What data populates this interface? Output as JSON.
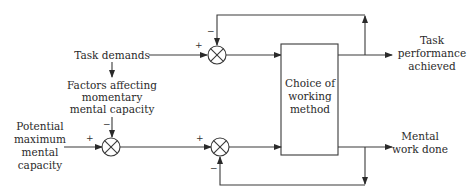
{
  "diagram": {
    "type": "control-loop block diagram",
    "line_color": "#3a3a3a",
    "text_color": "#2a2a2a",
    "background": "#ffffff",
    "nodes": {
      "task_demands": {
        "lines": [
          "Task demands"
        ]
      },
      "factors": {
        "lines": [
          "Factors affecting",
          "momentary",
          "mental capacity"
        ]
      },
      "potential": {
        "lines": [
          "Potential",
          "maximum",
          "mental",
          "capacity"
        ]
      },
      "choice_box": {
        "lines": [
          "Choice of",
          "working",
          "method"
        ]
      },
      "task_performance": {
        "lines": [
          "Task",
          "performance",
          "achieved"
        ]
      },
      "mental_work": {
        "lines": [
          "Mental",
          "work done"
        ]
      }
    },
    "summing_junctions": [
      {
        "id": "top-summer",
        "inputs": {
          "plus": "Task demands",
          "minus": "Task performance achieved (feedback)"
        }
      },
      {
        "id": "capacity-summer",
        "inputs": {
          "plus": "Potential maximum mental capacity",
          "minus": "Factors affecting momentary mental capacity"
        }
      },
      {
        "id": "work-summer",
        "inputs": {
          "plus": "Available mental capacity",
          "minus": "Mental work done (feedback)"
        }
      }
    ],
    "signs": {
      "plus": "+",
      "minus": "−"
    }
  }
}
